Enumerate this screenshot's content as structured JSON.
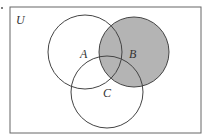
{
  "diagram": {
    "type": "venn",
    "universe_label": "U",
    "sets": [
      {
        "label": "A",
        "shaded": false
      },
      {
        "label": "B",
        "shaded": true
      },
      {
        "label": "C",
        "shaded": false
      }
    ],
    "shaded_region": "B",
    "colors": {
      "shade": "#b4b4b4",
      "stroke": "#444444",
      "background": "#ffffff"
    }
  }
}
